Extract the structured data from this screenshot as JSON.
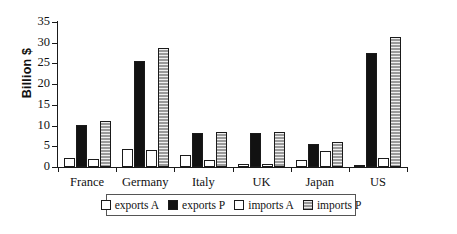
{
  "chart_data": {
    "type": "bar",
    "title": "",
    "xlabel": "",
    "ylabel": "Billion $",
    "ylim": [
      0,
      35
    ],
    "yticks": [
      0,
      5,
      10,
      15,
      20,
      25,
      30,
      35
    ],
    "grid": false,
    "legend_position": "bottom",
    "categories": [
      "France",
      "Germany",
      "Italy",
      "UK",
      "Japan",
      "US"
    ],
    "series": [
      {
        "name": "exports A",
        "style": "white",
        "values": [
          2.2,
          4.4,
          2.8,
          0.7,
          1.8,
          0.5
        ]
      },
      {
        "name": "exports P",
        "style": "black",
        "values": [
          10.2,
          25.7,
          8.2,
          8.2,
          5.5,
          27.5
        ]
      },
      {
        "name": "imports A",
        "style": "white",
        "values": [
          2.0,
          4.1,
          1.7,
          0.8,
          3.9,
          2.2
        ]
      },
      {
        "name": "imports P",
        "style": "gray",
        "values": [
          11.1,
          28.7,
          8.5,
          8.4,
          6.0,
          31.5
        ]
      }
    ],
    "colors": {
      "white": "#ffffff",
      "black": "#121212",
      "gray": "#9a9a9a",
      "axis": "#1a1a1a",
      "background": "#ffffff"
    }
  }
}
